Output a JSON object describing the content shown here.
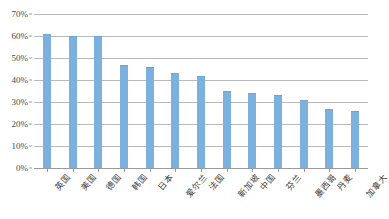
{
  "chart_data": {
    "type": "bar",
    "title": "",
    "subtitle": "",
    "xlabel": "",
    "ylabel": "",
    "ylim": [
      0,
      70
    ],
    "ytick_labels": [
      "70%",
      "60%",
      "50%",
      "40%",
      "30%",
      "20%",
      "10%",
      "0%"
    ],
    "ytick_values": [
      70,
      60,
      50,
      40,
      30,
      20,
      10,
      0
    ],
    "grid": true,
    "legend": false,
    "legend_position": "none",
    "series_color": "#7cb0de",
    "categories": [
      "英国",
      "美国",
      "德国",
      "韩国",
      "日本",
      "爱尔兰",
      "法国",
      "新加坡",
      "中国",
      "芬兰",
      "墨西哥",
      "丹麦",
      "加拿大"
    ],
    "values": [
      61,
      60,
      60,
      47,
      46,
      43,
      42,
      35,
      34,
      33,
      31,
      27,
      26
    ],
    "series": [
      {
        "name": "",
        "values": [
          61,
          60,
          60,
          47,
          46,
          43,
          42,
          35,
          34,
          33,
          31,
          27,
          26
        ]
      }
    ],
    "annotations": []
  },
  "colors": {
    "bar": "#7cb0de",
    "bar_edge": "#6ea5d6",
    "gridline": "#b9b9b9",
    "axis": "#9a9a9a",
    "tick_text": "#4a4a4a",
    "category_text": "#3d3d3d",
    "background": "#ffffff"
  }
}
